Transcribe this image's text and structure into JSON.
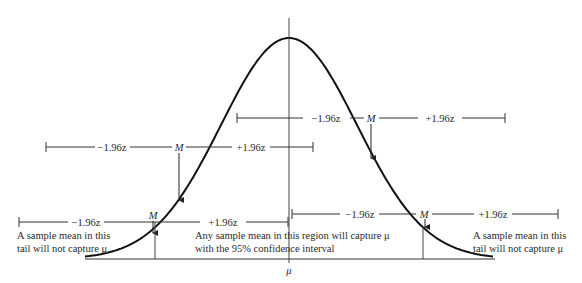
{
  "diagram": {
    "title": "",
    "mu_label": "μ",
    "curve": {
      "type": "normal",
      "mean_label": "μ"
    },
    "intervals": [
      {
        "id": "upper-right",
        "minus_label": "−1.96z",
        "mean_label": "M",
        "plus_label": "+1.96z",
        "captures_mu": true,
        "sample_mean_position_sd": 1.0
      },
      {
        "id": "middle-left",
        "minus_label": "−1.96z",
        "mean_label": "M",
        "plus_label": "+1.96z",
        "captures_mu": true,
        "sample_mean_position_sd": -1.3
      },
      {
        "id": "lower-left",
        "minus_label": "−1.96z",
        "mean_label": "M",
        "plus_label": "+1.96z",
        "captures_mu": false,
        "sample_mean_position_sd": -1.96
      },
      {
        "id": "lower-right",
        "minus_label": "−1.96z",
        "mean_label": "M",
        "plus_label": "+1.96z",
        "captures_mu": false,
        "sample_mean_position_sd": 1.96
      }
    ],
    "annotations": {
      "left_tail": [
        "A sample mean in this",
        "tail will not capture μ"
      ],
      "center": [
        "Any sample mean in this region will capture μ",
        "with the 95% confidence interval"
      ],
      "right_tail": [
        "A sample mean in this",
        "tail will not capture μ"
      ]
    }
  }
}
